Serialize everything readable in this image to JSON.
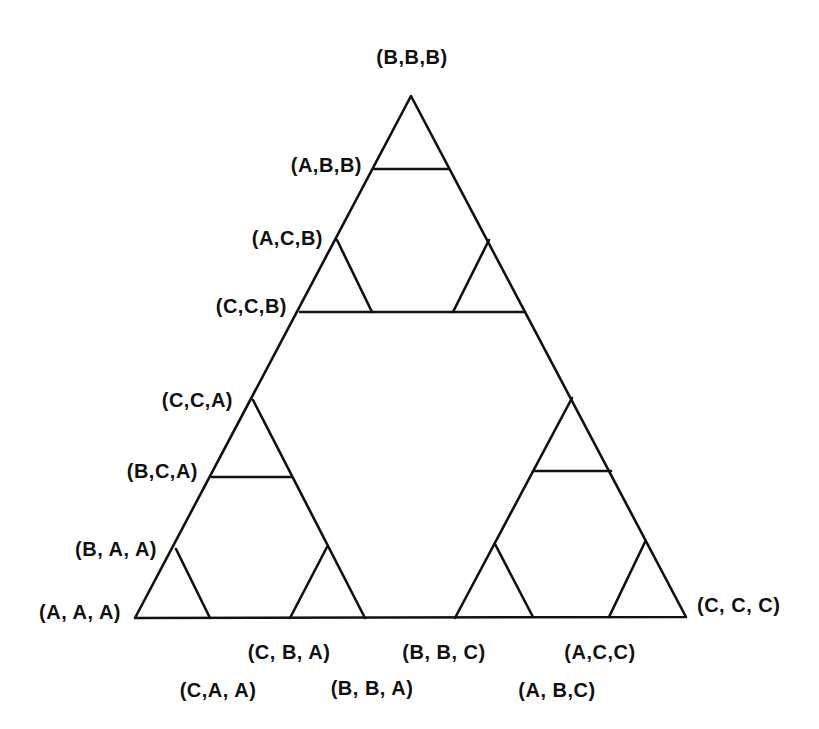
{
  "diagram": {
    "type": "sierpinski-state-graph",
    "stroke_color": "#111111",
    "background": "#ffffff",
    "outer_triangle": {
      "apex": [
        411,
        96
      ],
      "bottom_left": [
        135,
        618
      ],
      "bottom_right": [
        686,
        617
      ]
    },
    "segments": [
      {
        "name": "top-inner-base",
        "from": [
          300,
          312
        ],
        "to": [
          525,
          312
        ]
      },
      {
        "name": "top-tip-base",
        "from": [
          374,
          169
        ],
        "to": [
          449,
          169
        ]
      },
      {
        "name": "top-left-small-right",
        "from": [
          337,
          240
        ],
        "to": [
          372,
          312
        ]
      },
      {
        "name": "top-right-small-left",
        "from": [
          489,
          240
        ],
        "to": [
          453,
          312
        ]
      },
      {
        "name": "bl-sub-right-side",
        "from": [
          253,
          400
        ],
        "to": [
          365,
          618
        ]
      },
      {
        "name": "bl-sub-mid-base",
        "from": [
          212,
          477
        ],
        "to": [
          292,
          477
        ]
      },
      {
        "name": "bl-left-small-right",
        "from": [
          176,
          549
        ],
        "to": [
          210,
          618
        ]
      },
      {
        "name": "bl-right-small-left",
        "from": [
          327,
          547
        ],
        "to": [
          290,
          618
        ]
      },
      {
        "name": "br-sub-left-side",
        "from": [
          572,
          398
        ],
        "to": [
          455,
          618
        ]
      },
      {
        "name": "br-sub-mid-base",
        "from": [
          533,
          471
        ],
        "to": [
          611,
          471
        ]
      },
      {
        "name": "br-left-small-right",
        "from": [
          495,
          544
        ],
        "to": [
          533,
          617
        ]
      },
      {
        "name": "br-right-small-left",
        "from": [
          645,
          542
        ],
        "to": [
          609,
          617
        ]
      }
    ],
    "labels": {
      "bbb": "(B,B,B)",
      "abb": "(A,B,B)",
      "acb": "(A,C,B)",
      "ccb": "(C,C,B)",
      "cca": "(C,C,A)",
      "bca": "(B,C,A)",
      "baa": "(B, A, A)",
      "aaa": "(A, A, A)",
      "ccc": "(C, C, C)",
      "cba": "(C, B, A)",
      "bbc": "(B, B, C)",
      "acc": "(A,C,C)",
      "caa": "(C,A, A)",
      "bba": "(B, B, A)",
      "abc": "(A, B,C)"
    }
  }
}
